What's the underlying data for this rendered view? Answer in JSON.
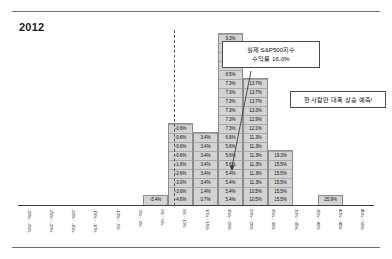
{
  "chart_data": {
    "type": "bar",
    "title": "2012",
    "xlabel": "",
    "ylabel": "",
    "grid": false,
    "legend": "none",
    "zero_line_after_category_index": 6,
    "categories": [
      "-30% ~ -25%",
      "-25% ~ -20%",
      "-20% ~ -15%",
      "-15% ~ -10%",
      "-10% ~ -5%",
      "-5% ~ 0%",
      "0% ~ 5%",
      "5% ~ 10%",
      "10% ~ 15%",
      "15% ~ 20%",
      "20% ~ 25%",
      "25% ~ 30%",
      "30% ~ 35%",
      "35% ~ 40%",
      "40% ~ 45%",
      "45% ~ 50%"
    ],
    "values": [
      0,
      0,
      0,
      0,
      0,
      1,
      9,
      8,
      17,
      13,
      6,
      0,
      1,
      0,
      0,
      0
    ],
    "stacked_labels": [
      [],
      [],
      [],
      [],
      [],
      [
        "-5.4%"
      ],
      [
        "-4.6%",
        "-3.6%",
        "-3.0%",
        "-2.6%",
        "-1.6%",
        "-0.6%",
        "-0.6%",
        "-0.6%",
        "-0.6%"
      ],
      [
        "0.7%",
        "1.4%",
        "3.4%",
        "3.4%",
        "3.4%",
        "3.4%",
        "3.4%",
        "3.4%"
      ],
      [
        "5.4%",
        "5.4%",
        "5.4%",
        "5.4%",
        "5.6%",
        "5.6%",
        "5.6%",
        "6.6%",
        "7.3%",
        "7.3%",
        "7.3%",
        "7.3%",
        "7.3%",
        "7.3%",
        "8.5%",
        "8.6%",
        "9.3%",
        "9.3%",
        "9.3%"
      ],
      [
        "10.5%",
        "10.5%",
        "11.3%",
        "11.3%",
        "11.3%",
        "11.3%",
        "11.3%",
        "11.3%",
        "12.1%",
        "12.9%",
        "13.3%",
        "13.7%",
        "13.7%",
        "13.7%"
      ],
      [
        "15.5%",
        "15.5%",
        "15.5%",
        "15.5%",
        "15.5%",
        "19.3%"
      ],
      [],
      [
        "25.9%"
      ],
      [],
      [],
      []
    ]
  },
  "annotations": {
    "actual_return": "실제 S&P500지수\n수익률 16.0%",
    "outlier_note": "한 사람만 대폭 상승 예측!"
  }
}
